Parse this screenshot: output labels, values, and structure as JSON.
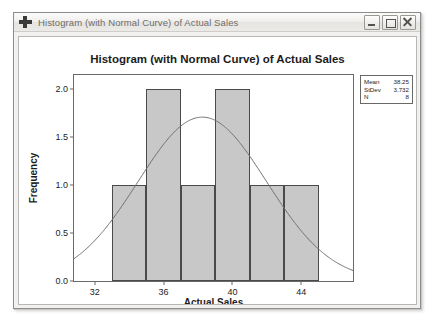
{
  "window": {
    "title": "Histogram (with Normal Curve) of Actual Sales",
    "icon": "plus-cross-icon",
    "buttons": {
      "minimize": "Minimize",
      "maximize": "Maximize",
      "close": "Close"
    }
  },
  "stats": {
    "rows": [
      {
        "label": "Mean",
        "value": "38.25"
      },
      {
        "label": "StDev",
        "value": "3.732"
      },
      {
        "label": "N",
        "value": "8"
      }
    ]
  },
  "chart_data": {
    "type": "bar",
    "title": "Histogram (with Normal Curve) of Actual Sales",
    "xlabel": "Actual Sales",
    "ylabel": "Frequency",
    "xlim": [
      30.8,
      47.0
    ],
    "ylim": [
      0,
      2.15
    ],
    "grid": false,
    "legend": "stats-box-top-right",
    "xticks": [
      "32",
      "36",
      "40",
      "44"
    ],
    "xtick_values": [
      32,
      36,
      40,
      44
    ],
    "yticks": [
      "0.0",
      "0.5",
      "1.0",
      "1.5",
      "2.0"
    ],
    "ytick_values": [
      0.0,
      0.5,
      1.0,
      1.5,
      2.0
    ],
    "bin_edges": [
      33,
      35,
      37,
      39,
      41,
      43,
      45
    ],
    "bin_centers": [
      34,
      36,
      38,
      40,
      42,
      44
    ],
    "values": [
      1,
      2,
      1,
      2,
      1,
      1
    ],
    "bar_color": "#c8c8c8",
    "bar_edge_color": "#4a4a4a",
    "overlay": {
      "name": "Normal curve",
      "type": "line",
      "mean": 38.25,
      "stdev": 3.732,
      "n": 8,
      "bin_width": 2,
      "peak_value": 1.71,
      "color": "#6f6f6f"
    }
  }
}
